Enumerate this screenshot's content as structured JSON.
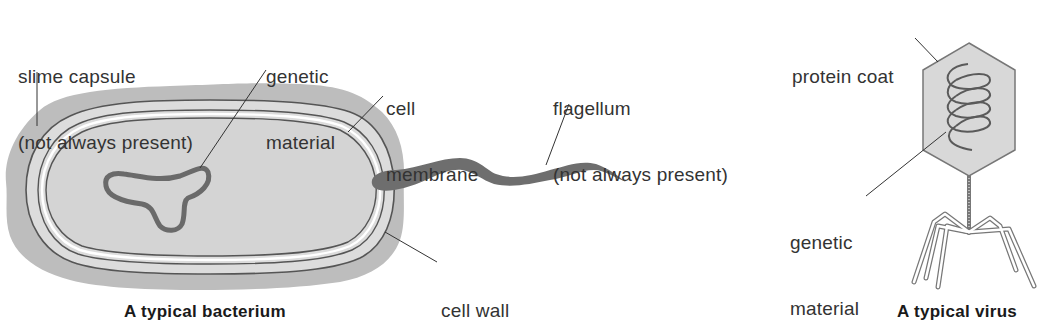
{
  "diagram": {
    "colors": {
      "capsule": "#b9b9b9",
      "wall": "#d8d8d8",
      "cytoplasm": "#d2d2d2",
      "outline": "#555555",
      "genetic_loop": "#6e6e6e",
      "flagellum": "#6e6e6e",
      "virus_coat": "#d6d6d6",
      "leader_line": "#333333",
      "text": "#333333"
    },
    "bacterium": {
      "caption": "A typical bacterium",
      "labels": {
        "slime_capsule_line1": "slime capsule",
        "slime_capsule_line2": "(not always present)",
        "genetic_material_line1": "genetic",
        "genetic_material_line2": "material",
        "cell_membrane_line1": "cell",
        "cell_membrane_line2": "membrane",
        "flagellum_line1": "flagellum",
        "flagellum_line2": "(not always present)",
        "cell_wall": "cell wall"
      }
    },
    "virus": {
      "caption": "A typical virus",
      "labels": {
        "protein_coat": "protein coat",
        "genetic_material_line1": "genetic",
        "genetic_material_line2": "material"
      }
    }
  }
}
